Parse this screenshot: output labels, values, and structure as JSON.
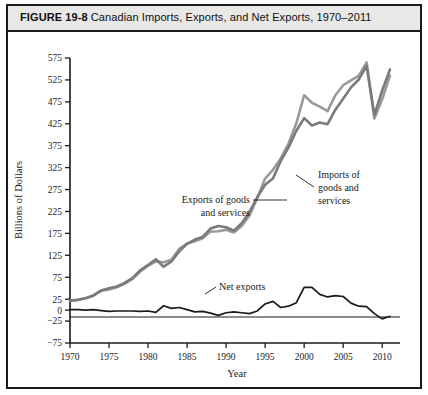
{
  "figure": {
    "number": "FIGURE 19-8",
    "title": "Canadian Imports, Exports, and Net Exports, 1970–2011"
  },
  "annotations": {
    "exports_label_line1": "Exports of goods",
    "exports_label_line2": "and services",
    "imports_label_line1": "Imports of",
    "imports_label_line2": "goods and",
    "imports_label_line3": "services",
    "net_label": "Net exports"
  },
  "chart_data": {
    "type": "line",
    "title": "Canadian Imports, Exports, and Net Exports, 1970–2011",
    "xlabel": "Year",
    "ylabel": "Billions of Dollars",
    "xlim": [
      1970,
      2011
    ],
    "ylim": [
      -75,
      575
    ],
    "grid": false,
    "legend": "annotated-inline",
    "xticks": [
      1970,
      1975,
      1980,
      1985,
      1990,
      1995,
      2000,
      2005,
      2010
    ],
    "xticklabels": [
      "1970",
      "1975",
      "1980",
      "1985",
      "1990",
      "1995",
      "2000",
      "2005",
      "2010"
    ],
    "yticks": [
      -75,
      -25,
      0,
      25,
      75,
      125,
      175,
      225,
      275,
      325,
      375,
      425,
      475,
      525,
      575
    ],
    "yticklabels": [
      "−75",
      "−25",
      "0",
      "25",
      "75",
      "125",
      "175",
      "225",
      "275",
      "325",
      "375",
      "425",
      "475",
      "525",
      "575"
    ],
    "x": [
      1970,
      1971,
      1972,
      1973,
      1974,
      1975,
      1976,
      1977,
      1978,
      1979,
      1980,
      1981,
      1982,
      1983,
      1984,
      1985,
      1986,
      1987,
      1988,
      1989,
      1990,
      1991,
      1992,
      1993,
      1994,
      1995,
      1996,
      1997,
      1998,
      1999,
      2000,
      2001,
      2002,
      2003,
      2004,
      2005,
      2006,
      2007,
      2008,
      2009,
      2010,
      2011
    ],
    "series": [
      {
        "name": "Exports of goods and services",
        "color": "#9a9a9a",
        "values": [
          22,
          24,
          27,
          34,
          44,
          47,
          52,
          60,
          71,
          88,
          101,
          111,
          109,
          115,
          140,
          152,
          157,
          164,
          179,
          180,
          183,
          177,
          192,
          216,
          256,
          300,
          320,
          346,
          380,
          426,
          490,
          473,
          464,
          454,
          490,
          513,
          524,
          535,
          565,
          437,
          481,
          535
        ]
      },
      {
        "name": "Imports of goods and services",
        "color": "#7a7a7a",
        "values": [
          21,
          23,
          27,
          33,
          45,
          50,
          54,
          62,
          73,
          91,
          103,
          116,
          99,
          111,
          134,
          151,
          161,
          167,
          186,
          192,
          189,
          181,
          198,
          224,
          258,
          286,
          300,
          340,
          371,
          409,
          438,
          421,
          428,
          424,
          457,
          482,
          508,
          526,
          557,
          445,
          501,
          549
        ]
      },
      {
        "name": "Net exports",
        "color": "#1a1a1a",
        "values": [
          1,
          1,
          0,
          1,
          -1,
          -3,
          -2,
          -2,
          -2,
          -3,
          -2,
          -5,
          10,
          4,
          6,
          1,
          -4,
          -3,
          -7,
          -12,
          -6,
          -4,
          -6,
          -8,
          -2,
          14,
          20,
          6,
          9,
          17,
          52,
          52,
          36,
          30,
          33,
          31,
          16,
          9,
          8,
          -8,
          -20,
          -14
        ]
      }
    ]
  }
}
